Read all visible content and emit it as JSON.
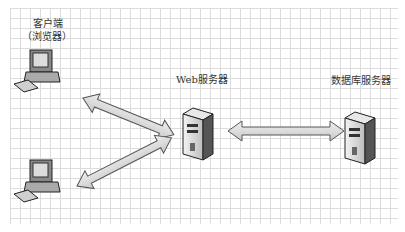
{
  "diagram": {
    "type": "architecture",
    "nodes": [
      {
        "id": "client1",
        "label_line1": "客户端",
        "label_line2": "（浏览器）",
        "icon": "desktop-computer-icon"
      },
      {
        "id": "client2",
        "icon": "desktop-computer-icon"
      },
      {
        "id": "web",
        "label": "Web服务器",
        "icon": "server-tower-icon"
      },
      {
        "id": "db",
        "label": "数据库服务器",
        "icon": "server-tower-icon"
      }
    ],
    "edges": [
      {
        "from": "client1",
        "to": "web",
        "style": "bidirectional-arrow"
      },
      {
        "from": "client2",
        "to": "web",
        "style": "bidirectional-arrow"
      },
      {
        "from": "web",
        "to": "db",
        "style": "bidirectional-arrow"
      }
    ],
    "colors": {
      "grid": "#dcdcdc",
      "arrow_fill": "#d8d8d8",
      "arrow_stroke": "#555555"
    }
  }
}
